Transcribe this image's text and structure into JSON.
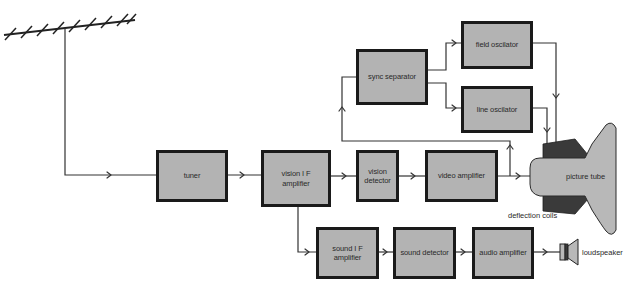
{
  "diagram": {
    "blocks": {
      "tuner": "tuner",
      "vision_if_amplifier": "vision I F\namplifier",
      "vision_detector": "vision\ndetector",
      "video_amplifier": "video amplifier",
      "sync_separator": "sync separator",
      "field_oscillator": "field oscilator",
      "line_oscillator": "line oscilator",
      "sound_if_amplifier": "sound I F\namplifier",
      "sound_detector": "sound detector",
      "audio_amplifier": "audio amplifier"
    },
    "labels": {
      "picture_tube": "picture tube",
      "deflection_coils": "deflection coils",
      "loudspeaker": "loudspeaker"
    },
    "icons": {
      "antenna": "antenna-icon",
      "picture_tube": "crt-icon",
      "loudspeaker": "speaker-icon"
    },
    "colors": {
      "block_fill": "#b3b3b3",
      "block_border": "#1a1a1a",
      "tube_fill": "#b8b8b8",
      "coil_fill": "#3a3a3a",
      "wire": "#333333"
    }
  }
}
